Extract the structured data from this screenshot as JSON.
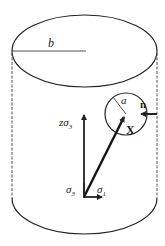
{
  "diagram": {
    "labels": {
      "cylinder_radius": "b",
      "inclusion_radius": "a",
      "normal_vector": "n",
      "position_vector": "X",
      "stress_axial": "zσ",
      "stress_axial_sub": "3",
      "stress_3": "σ",
      "stress_3_sub": "3",
      "stress_1": "σ",
      "stress_1_sub": "1"
    },
    "colors": {
      "stroke": "#222222",
      "background": "#ffffff"
    }
  }
}
